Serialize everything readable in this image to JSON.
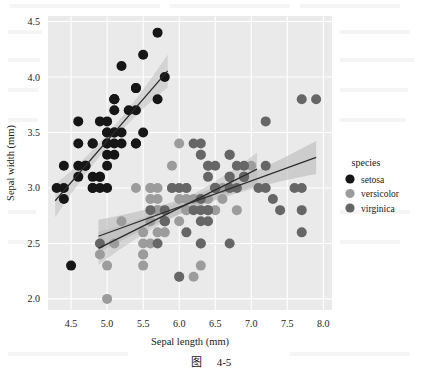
{
  "figure": {
    "caption": "图　4-5",
    "caption_label": "图",
    "caption_number": "4-5"
  },
  "legend": {
    "title": "species",
    "position": "right",
    "items": [
      {
        "label": "setosa",
        "color": "#161616"
      },
      {
        "label": "versicolor",
        "color": "#9c9c9c"
      },
      {
        "label": "virginica",
        "color": "#666666"
      }
    ]
  },
  "chart_data": {
    "type": "scatter",
    "title": "",
    "xlabel": "Sepal length (mm)",
    "ylabel": "Sepal width (mm)",
    "xlim": [
      4.18,
      8.12
    ],
    "ylim": [
      1.9,
      4.55
    ],
    "xticks": [
      "4.5",
      "5.0",
      "5.5",
      "6.0",
      "6.5",
      "7.0",
      "7.5",
      "8.0"
    ],
    "xtick_values": [
      4.5,
      5.0,
      5.5,
      6.0,
      6.5,
      7.0,
      7.5,
      8.0
    ],
    "yticks": [
      "2.0",
      "2.5",
      "3.0",
      "3.5",
      "4.0",
      "4.5"
    ],
    "ytick_values": [
      2.0,
      2.5,
      3.0,
      3.5,
      4.0,
      4.5
    ],
    "grid": true,
    "grid_color": "#ffffff",
    "plot_bg": "#eaeaea",
    "legend_position": "right",
    "marker_size": 5.0,
    "series": [
      {
        "name": "setosa",
        "color": "#161616",
        "x": [
          5.1,
          4.9,
          4.7,
          4.6,
          5.0,
          5.4,
          4.6,
          5.0,
          4.4,
          4.9,
          5.4,
          4.8,
          4.8,
          4.3,
          5.8,
          5.7,
          5.4,
          5.1,
          5.7,
          5.1,
          5.4,
          5.1,
          4.6,
          5.1,
          4.8,
          5.0,
          5.0,
          5.2,
          5.2,
          4.7,
          4.8,
          5.4,
          5.2,
          5.5,
          4.9,
          5.0,
          5.5,
          4.9,
          4.4,
          5.1,
          5.0,
          4.5,
          4.4,
          5.0,
          5.1,
          4.8,
          5.1,
          4.6,
          5.3,
          5.0
        ],
        "y": [
          3.5,
          3.0,
          3.2,
          3.1,
          3.6,
          3.9,
          3.4,
          3.4,
          2.9,
          3.1,
          3.7,
          3.4,
          3.0,
          3.0,
          4.0,
          4.4,
          3.9,
          3.5,
          3.8,
          3.8,
          3.4,
          3.7,
          3.6,
          3.3,
          3.4,
          3.0,
          3.4,
          3.5,
          3.4,
          3.2,
          3.1,
          3.4,
          4.1,
          4.2,
          3.1,
          3.2,
          3.5,
          3.6,
          3.0,
          3.4,
          3.5,
          2.3,
          3.2,
          3.5,
          3.8,
          3.0,
          3.8,
          3.2,
          3.7,
          3.3
        ],
        "fit": {
          "x0": 4.28,
          "y0": 2.885,
          "x1": 5.84,
          "y1": 4.055
        },
        "band_color": "#bfbfbf"
      },
      {
        "name": "versicolor",
        "color": "#9c9c9c",
        "x": [
          7.0,
          6.4,
          6.9,
          5.5,
          6.5,
          5.7,
          6.3,
          4.9,
          6.6,
          5.2,
          5.0,
          5.9,
          6.0,
          6.1,
          5.6,
          6.7,
          5.6,
          5.8,
          6.2,
          5.6,
          5.9,
          6.1,
          6.3,
          6.1,
          6.4,
          6.6,
          6.8,
          6.7,
          6.0,
          5.7,
          5.5,
          5.5,
          5.8,
          6.0,
          5.4,
          6.0,
          6.7,
          6.3,
          5.6,
          5.5,
          5.5,
          6.1,
          5.8,
          5.0,
          5.6,
          5.7,
          5.7,
          6.2,
          5.1,
          5.7
        ],
        "y": [
          3.2,
          3.2,
          3.1,
          2.3,
          2.8,
          2.8,
          3.3,
          2.4,
          2.9,
          2.7,
          2.0,
          3.0,
          2.2,
          2.9,
          2.9,
          3.1,
          3.0,
          2.7,
          2.2,
          2.5,
          3.2,
          2.8,
          2.5,
          2.8,
          2.9,
          3.0,
          2.8,
          3.0,
          2.9,
          2.6,
          2.4,
          2.4,
          2.7,
          2.7,
          3.0,
          3.4,
          3.1,
          2.3,
          3.0,
          2.5,
          2.6,
          3.0,
          2.6,
          2.3,
          2.7,
          3.0,
          2.9,
          2.9,
          2.5,
          2.8
        ],
        "fit": {
          "x0": 4.88,
          "y0": 2.455,
          "x1": 7.08,
          "y1": 3.17
        },
        "band_color": "#bfbfbf"
      },
      {
        "name": "virginica",
        "color": "#666666",
        "x": [
          6.3,
          5.8,
          7.1,
          6.3,
          6.5,
          7.6,
          4.9,
          7.3,
          6.7,
          7.2,
          6.5,
          6.4,
          6.8,
          5.7,
          5.8,
          6.4,
          6.5,
          7.7,
          7.7,
          6.0,
          6.9,
          5.6,
          7.7,
          6.3,
          6.7,
          7.2,
          6.2,
          6.1,
          6.4,
          7.2,
          7.4,
          7.9,
          6.4,
          6.3,
          6.1,
          7.7,
          6.3,
          6.4,
          6.0,
          6.9,
          6.7,
          6.9,
          5.8,
          6.8,
          6.7,
          6.7,
          6.3,
          6.5,
          6.2,
          5.9
        ],
        "y": [
          3.3,
          2.7,
          3.0,
          2.9,
          3.0,
          3.0,
          2.5,
          2.9,
          2.5,
          3.6,
          3.2,
          2.7,
          3.0,
          2.5,
          2.8,
          3.2,
          3.0,
          3.8,
          2.6,
          2.2,
          3.2,
          2.8,
          2.8,
          2.7,
          3.3,
          3.2,
          2.8,
          3.0,
          2.8,
          3.0,
          2.8,
          3.8,
          2.8,
          2.8,
          2.6,
          3.0,
          3.4,
          3.1,
          3.0,
          3.1,
          3.1,
          3.1,
          2.7,
          3.2,
          3.3,
          3.0,
          2.5,
          3.0,
          3.4,
          3.0
        ],
        "fit": {
          "x0": 4.88,
          "y0": 2.565,
          "x1": 7.9,
          "y1": 3.275
        },
        "band_color": "#b5b5b5"
      }
    ]
  }
}
